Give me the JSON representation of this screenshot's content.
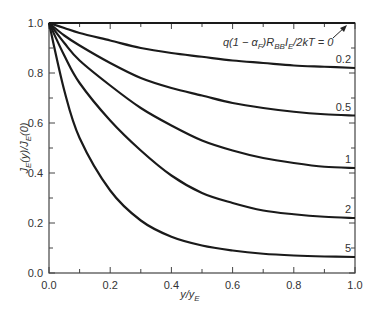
{
  "chart_data": {
    "type": "line",
    "title": "",
    "xlabel": "y/y_E",
    "ylabel": "J_E(y)/J_E(0)",
    "xlim": [
      0.0,
      1.0
    ],
    "ylim": [
      0.0,
      1.0
    ],
    "xticks": [
      "0.0",
      "0.2",
      "0.4",
      "0.6",
      "0.8",
      "1.0"
    ],
    "yticks": [
      "0.0",
      "0.2",
      "0.4",
      "0.6",
      "0.8",
      "1.0"
    ],
    "grid": false,
    "annotation": "q(1 − α_F)R_BB I_E/2kT = 0",
    "parameter_name": "q(1 − α_F)R_BB I_E/2kT",
    "x": [
      0.0,
      0.05,
      0.1,
      0.2,
      0.3,
      0.4,
      0.5,
      0.6,
      0.7,
      0.8,
      0.9,
      1.0
    ],
    "series": [
      {
        "name": "0",
        "label": "",
        "values": [
          1.0,
          1.0,
          1.0,
          1.0,
          1.0,
          1.0,
          1.0,
          1.0,
          1.0,
          1.0,
          1.0,
          1.0
        ]
      },
      {
        "name": "0.2",
        "label": "0.2",
        "values": [
          1.0,
          0.98,
          0.96,
          0.93,
          0.9,
          0.88,
          0.865,
          0.85,
          0.84,
          0.83,
          0.825,
          0.82
        ]
      },
      {
        "name": "0.5",
        "label": "0.5",
        "values": [
          1.0,
          0.95,
          0.91,
          0.84,
          0.78,
          0.74,
          0.71,
          0.68,
          0.66,
          0.645,
          0.635,
          0.63
        ]
      },
      {
        "name": "1",
        "label": "1",
        "values": [
          1.0,
          0.92,
          0.85,
          0.75,
          0.66,
          0.59,
          0.53,
          0.49,
          0.46,
          0.44,
          0.425,
          0.42
        ]
      },
      {
        "name": "2",
        "label": "2",
        "values": [
          1.0,
          0.87,
          0.76,
          0.61,
          0.49,
          0.39,
          0.32,
          0.28,
          0.25,
          0.235,
          0.225,
          0.22
        ]
      },
      {
        "name": "5",
        "label": "5",
        "values": [
          1.0,
          0.73,
          0.54,
          0.33,
          0.21,
          0.145,
          0.11,
          0.09,
          0.077,
          0.07,
          0.066,
          0.064
        ]
      }
    ]
  },
  "labels": {
    "annotation": "q(1 − α",
    "annotation_sub_f": "F",
    "annotation_mid": ")R",
    "annotation_sub_bb": "BB",
    "annotation_ie": "I",
    "annotation_sub_e": "E",
    "annotation_end": "/2kT = 0",
    "xlabel_main": "y/y",
    "xlabel_sub": "E",
    "ylabel_text": "J_E(y)/J_E(0)"
  }
}
